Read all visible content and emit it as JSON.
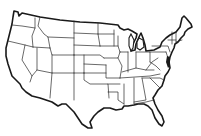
{
  "map": {
    "subject": "United States outline map",
    "style": "black state borders on white, no labels",
    "colors": {
      "background": "#ffffff",
      "outline": "#1a1a1a"
    },
    "labels": []
  }
}
